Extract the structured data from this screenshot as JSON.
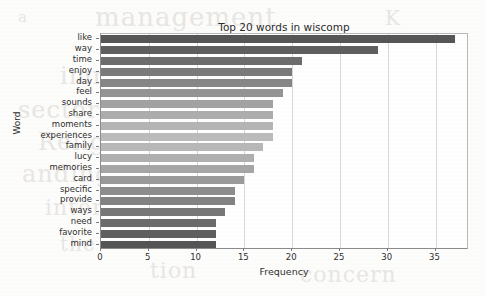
{
  "chart_data": {
    "type": "bar",
    "orientation": "horizontal",
    "title": "Top 20 words in wiscomp",
    "xlabel": "Frequency",
    "ylabel": "Word",
    "categories": [
      "like",
      "way",
      "time",
      "enjoy",
      "day",
      "feel",
      "sounds",
      "share",
      "moments",
      "experiences",
      "family",
      "lucy",
      "memories",
      "card",
      "specific",
      "provide",
      "ways",
      "need",
      "favorite",
      "mind"
    ],
    "values": [
      37,
      29,
      21,
      20,
      20,
      19,
      18,
      18,
      18,
      18,
      17,
      16,
      16,
      15,
      14,
      14,
      13,
      12,
      12,
      12
    ],
    "xlim": [
      0,
      38.5
    ],
    "xticks": [
      0,
      5,
      10,
      15,
      20,
      25,
      30,
      35
    ],
    "xticklabels": [
      "0",
      "5",
      "10",
      "15",
      "20",
      "25",
      "30",
      "35"
    ],
    "grid": true,
    "grid_axis": "x",
    "legend": null,
    "bar_colors": [
      "#565656",
      "#5f5f5f",
      "#6d6d6d",
      "#7a7a7a",
      "#868686",
      "#949494",
      "#a2a2a2",
      "#adadad",
      "#b5b5b5",
      "#bcbcbc",
      "#b8b8b8",
      "#b0b0b0",
      "#a6a6a6",
      "#9a9a9a",
      "#8d8d8d",
      "#838383",
      "#787878",
      "#6b6b6b",
      "#5f5f5f",
      "#555555"
    ]
  },
  "background_text": [
    {
      "text": "management",
      "top": 2,
      "left": 95,
      "size": 26
    },
    {
      "text": "K",
      "top": 6,
      "left": 385,
      "size": 20
    },
    {
      "text": "a",
      "top": 8,
      "left": 18,
      "size": 15
    },
    {
      "text": "immig atio",
      "top": 62,
      "left": 60,
      "size": 24
    },
    {
      "text": "sectoral",
      "top": 96,
      "left": 18,
      "size": 24
    },
    {
      "text": "Religion",
      "top": 128,
      "left": 38,
      "size": 24
    },
    {
      "text": "anding",
      "top": 160,
      "left": 22,
      "size": 24
    },
    {
      "text": "internal",
      "top": 195,
      "left": 45,
      "size": 22
    },
    {
      "text": "the",
      "top": 232,
      "left": 60,
      "size": 20
    },
    {
      "text": "tion",
      "top": 258,
      "left": 150,
      "size": 22
    },
    {
      "text": "concern",
      "top": 262,
      "left": 300,
      "size": 22
    }
  ]
}
